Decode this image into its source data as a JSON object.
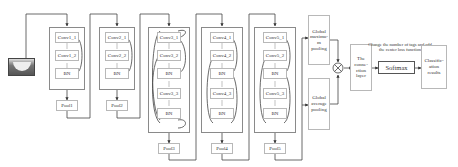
{
  "input": {
    "icon": "input-image"
  },
  "stages": [
    {
      "convs": [
        "Conv1_1",
        "Conv1_2",
        "BN"
      ],
      "pool": "Pool1"
    },
    {
      "convs": [
        "Conv2_1",
        "Conv2_2",
        "BN"
      ],
      "pool": "Pool2"
    },
    {
      "convs": [
        "Conv3_1",
        "Conv3_2",
        "BN",
        "Conv3_3",
        "BN"
      ],
      "pool": "Pool3"
    },
    {
      "convs": [
        "Conv4_1",
        "Conv4_2",
        "BN",
        "Conv4_3",
        "BN"
      ],
      "pool": "Pool4"
    },
    {
      "convs": [
        "Conv5_1",
        "Conv5_2",
        "BN",
        "Conv5_3",
        "BN"
      ],
      "pool": "Pool5"
    }
  ],
  "global_max": "Global maximu-m pooling",
  "global_avg": "Global average pooling",
  "concat_op": "⊗",
  "connection_layer": "The conne-ction layer",
  "softmax_note": "Change the number of tags and add the center loss function",
  "softmax": "Softmax",
  "result": "Classific-ation results"
}
